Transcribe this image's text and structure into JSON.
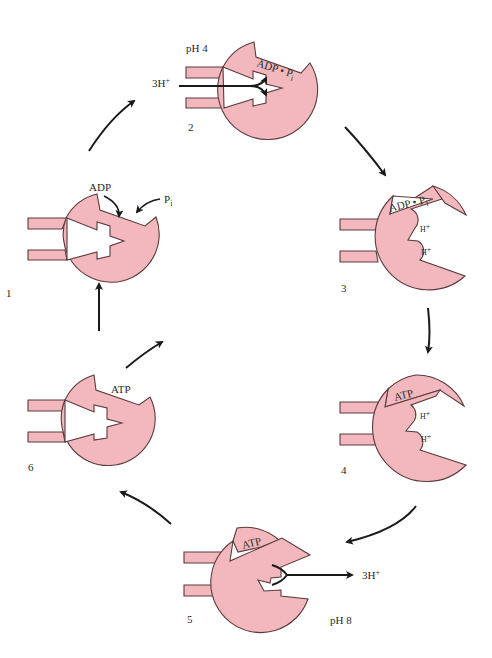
{
  "diagram": {
    "type": "cycle",
    "fill_color": "#f2b8bd",
    "outline_color": "#5a3a3c",
    "states": [
      {
        "number": "1",
        "site_label": "",
        "inputs": [
          "ADP",
          "P"
        ],
        "inputs_subscript": [
          "",
          "i"
        ]
      },
      {
        "number": "2",
        "site_label_main": "ADP • P",
        "site_label_sub": "i",
        "ph": "pH 4",
        "proton_in": "3H",
        "proton_sup": "+"
      },
      {
        "number": "3",
        "site_label_main": "ADP • P",
        "site_label_sub": "i",
        "proton_sites": [
          "H",
          "H"
        ],
        "proton_sup": "+"
      },
      {
        "number": "4",
        "site_label_main": "ATP",
        "proton_sites": [
          "H",
          "H"
        ],
        "proton_sup": "+"
      },
      {
        "number": "5",
        "site_label_main": "ATP",
        "ph": "pH 8",
        "proton_out": "3H",
        "proton_sup": "+"
      },
      {
        "number": "6",
        "site_label_main": "ATP"
      }
    ],
    "labels": {
      "adp": "ADP",
      "pi_main": "P",
      "pi_sub": "i",
      "ph4": "pH 4",
      "ph8": "pH 8",
      "h3": "3H",
      "plus": "+",
      "h": "H",
      "adp_pi_main": "ADP • P",
      "atp": "ATP"
    }
  }
}
